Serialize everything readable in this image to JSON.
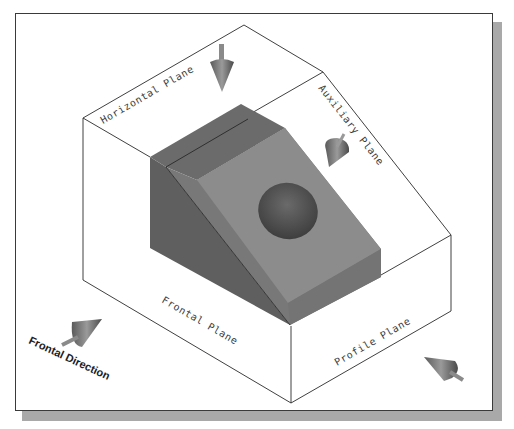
{
  "diagram": {
    "colors": {
      "background": "#ffffff",
      "frame_border": "#3a3a3a",
      "frame_shadow": "#a9a9a9",
      "box_edge": "#2a2a2a",
      "block_top": "#6b6b6b",
      "block_left": "#5f5f5f",
      "block_inclined": "#8c8c8c",
      "block_right": "#7a7a7a",
      "block_front": "#737373",
      "hole": "#4f4f4f",
      "arrow": "#777777"
    },
    "planes": {
      "horizontal": "Horizontal Plane",
      "auxiliary": "Auxiliary Plane",
      "frontal": "Frontal Plane",
      "profile": "Profile Plane"
    },
    "direction_label": "Frontal Direction",
    "arrows": [
      {
        "name": "horizontal-view-arrow",
        "direction": "down"
      },
      {
        "name": "auxiliary-view-arrow",
        "direction": "down-left"
      },
      {
        "name": "frontal-view-arrow",
        "direction": "up-right"
      },
      {
        "name": "profile-view-arrow",
        "direction": "up-left"
      }
    ]
  }
}
